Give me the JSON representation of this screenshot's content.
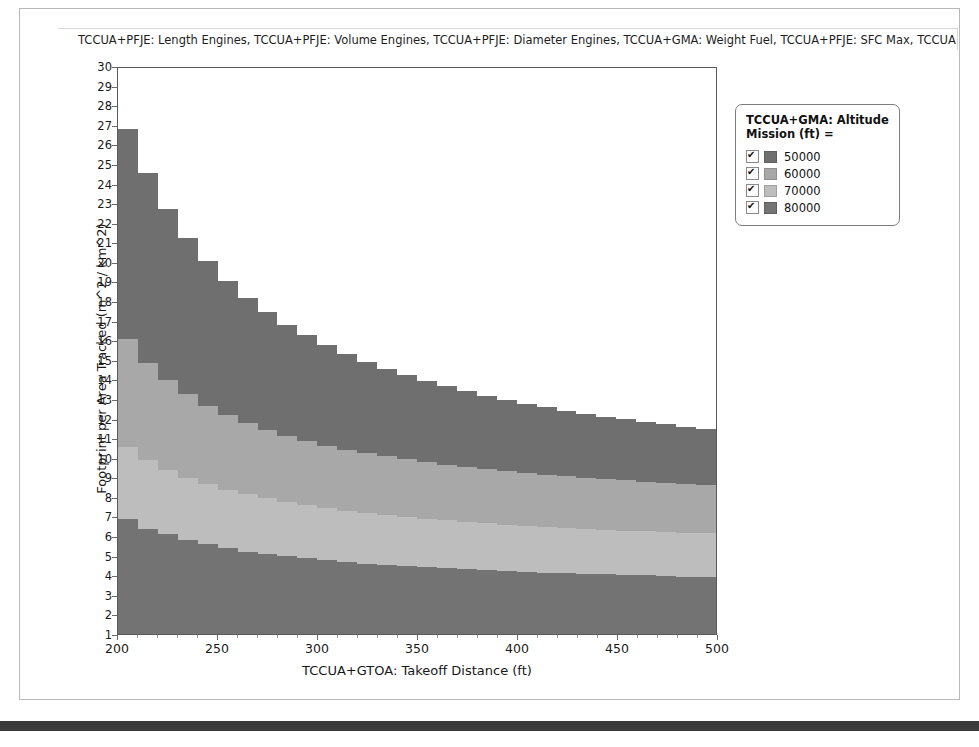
{
  "window": {
    "background_color": "#ffffff",
    "panel_border_color": "#b9b9b9",
    "bottom_bar_color": "#3b3b3b"
  },
  "chart": {
    "title": "TCCUA+PFJE: Length Engines, TCCUA+PFJE: Volume Engines, TCCUA+PFJE: Diameter Engines, TCCUA+GMA: Weight Fuel, TCCUA+PFJE: SFC Max, TCCUA+PFJE: S"
  },
  "legend": {
    "title": "TCCUA+GMA: Altitude Mission (ft) =",
    "items": [
      {
        "label": "50000",
        "color": "#6f6f6f",
        "checked": true
      },
      {
        "label": "60000",
        "color": "#a8a8a8",
        "checked": true
      },
      {
        "label": "70000",
        "color": "#bdbdbd",
        "checked": true
      },
      {
        "label": "80000",
        "color": "#737373",
        "checked": true
      }
    ]
  },
  "chart_data": {
    "type": "area",
    "title": "TCCUA+PFJE: Length Engines, TCCUA+PFJE: Volume Engines, TCCUA+PFJE: Diameter Engines, TCCUA+GMA: Weight Fuel, TCCUA+PFJE: SFC Max, TCCUA+PFJE: S",
    "xlabel": "TCCUA+GTOA: Takeoff Distance (ft)",
    "ylabel": "Footprint per Area Tracked (m^2 / km^2)",
    "xlim": [
      200,
      500
    ],
    "ylim": [
      1,
      30
    ],
    "xticks": [
      200,
      250,
      300,
      350,
      400,
      450,
      500
    ],
    "yticks": [
      1,
      2,
      3,
      4,
      5,
      6,
      7,
      8,
      9,
      10,
      11,
      12,
      13,
      14,
      15,
      16,
      17,
      18,
      19,
      20,
      21,
      22,
      23,
      24,
      25,
      26,
      27,
      28,
      29,
      30
    ],
    "grid": false,
    "legend_position": "right",
    "stacked": true,
    "step": true,
    "baseline": 1,
    "x": [
      200,
      210,
      220,
      230,
      240,
      250,
      260,
      270,
      280,
      290,
      300,
      310,
      320,
      330,
      340,
      350,
      360,
      370,
      380,
      390,
      400,
      410,
      420,
      430,
      440,
      450,
      460,
      470,
      480,
      490,
      500
    ],
    "series": [
      {
        "name": "80000",
        "color": "#737373",
        "cumulative_top": [
          6.9,
          6.4,
          6.1,
          5.8,
          5.6,
          5.4,
          5.2,
          5.1,
          5.0,
          4.9,
          4.8,
          4.7,
          4.6,
          4.55,
          4.5,
          4.45,
          4.4,
          4.35,
          4.3,
          4.25,
          4.2,
          4.15,
          4.1,
          4.08,
          4.05,
          4.02,
          4.0,
          3.95,
          3.92,
          3.9,
          3.9
        ]
      },
      {
        "name": "70000",
        "color": "#bdbdbd",
        "cumulative_top": [
          10.6,
          9.9,
          9.4,
          9.0,
          8.7,
          8.4,
          8.15,
          7.95,
          7.75,
          7.6,
          7.45,
          7.3,
          7.2,
          7.1,
          7.0,
          6.9,
          6.82,
          6.75,
          6.68,
          6.6,
          6.55,
          6.5,
          6.45,
          6.4,
          6.35,
          6.3,
          6.26,
          6.22,
          6.18,
          6.15,
          6.12
        ]
      },
      {
        "name": "60000",
        "color": "#a8a8a8",
        "cumulative_top": [
          16.1,
          14.9,
          14.0,
          13.3,
          12.7,
          12.2,
          11.8,
          11.45,
          11.15,
          10.9,
          10.65,
          10.45,
          10.25,
          10.1,
          9.95,
          9.8,
          9.68,
          9.56,
          9.45,
          9.35,
          9.25,
          9.17,
          9.09,
          9.01,
          8.94,
          8.87,
          8.81,
          8.75,
          8.69,
          8.64,
          8.6
        ]
      },
      {
        "name": "50000",
        "color": "#6f6f6f",
        "cumulative_top": [
          26.9,
          24.6,
          22.8,
          21.3,
          20.1,
          19.1,
          18.2,
          17.5,
          16.85,
          16.3,
          15.8,
          15.35,
          14.95,
          14.6,
          14.28,
          13.98,
          13.7,
          13.45,
          13.22,
          13.0,
          12.8,
          12.62,
          12.45,
          12.29,
          12.14,
          12.0,
          11.87,
          11.75,
          11.63,
          11.52,
          11.42
        ]
      }
    ]
  },
  "axes": {
    "x_title": "TCCUA+GTOA: Takeoff Distance (ft)",
    "y_title": "Footprint per Area Tracked (m^2 / km^2)"
  }
}
